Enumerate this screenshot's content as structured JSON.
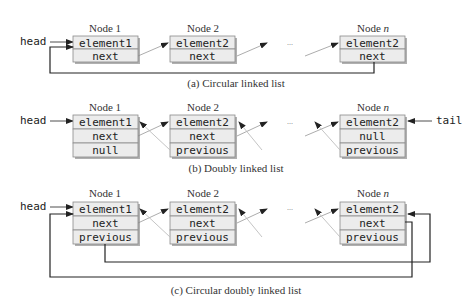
{
  "colors": {
    "cell_fill": "#ececec",
    "cell_border": "#8a8a8a",
    "shadow": "#b0b0b0",
    "line": "#222222",
    "pointer_line": "#888888",
    "back_line": "#bdbdbd"
  },
  "sections": [
    {
      "id": "a",
      "caption": "(a) Circular linked list",
      "head_label": "head",
      "nodes": [
        {
          "title": "Node 1",
          "fields": [
            "element1",
            "next"
          ]
        },
        {
          "title": "Node 2",
          "fields": [
            "element2",
            "next"
          ]
        },
        {
          "title_prefix": "Node ",
          "title_var": "n",
          "fields": [
            "element2",
            "next"
          ]
        }
      ],
      "ellipsis": "..."
    },
    {
      "id": "b",
      "caption": "(b) Doubly linked list",
      "head_label": "head",
      "tail_label": "tail",
      "nodes": [
        {
          "title": "Node 1",
          "fields": [
            "element1",
            "next",
            "null"
          ]
        },
        {
          "title": "Node 2",
          "fields": [
            "element2",
            "next",
            "previous"
          ]
        },
        {
          "title_prefix": "Node ",
          "title_var": "n",
          "fields": [
            "element2",
            "null",
            "previous"
          ]
        }
      ],
      "ellipsis": "..."
    },
    {
      "id": "c",
      "caption": "(c) Circular doubly linked list",
      "head_label": "head",
      "nodes": [
        {
          "title": "Node 1",
          "fields": [
            "element1",
            "next",
            "previous"
          ]
        },
        {
          "title": "Node 2",
          "fields": [
            "element2",
            "next",
            "previous"
          ]
        },
        {
          "title_prefix": "Node ",
          "title_var": "n",
          "fields": [
            "element2",
            "next",
            "previous"
          ]
        }
      ],
      "ellipsis": "..."
    }
  ]
}
